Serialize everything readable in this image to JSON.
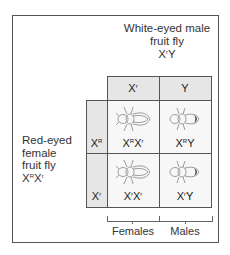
{
  "title": {
    "line1": "White-eyed male",
    "line2": "fruit fly",
    "genotype_base": "X",
    "genotype_sup": "r",
    "genotype_tail": "Y"
  },
  "side": {
    "line1": "Red-eyed",
    "line2": "female",
    "line3": "fruit fly",
    "genotype": [
      {
        "b": "X",
        "s": "R"
      },
      {
        "b": "X",
        "s": "r"
      }
    ]
  },
  "columns": [
    {
      "b": "X",
      "s": "r"
    },
    {
      "b": "Y",
      "s": ""
    }
  ],
  "rows": [
    {
      "b": "X",
      "s": "R"
    },
    {
      "b": "X",
      "s": "r"
    }
  ],
  "cells": [
    [
      {
        "a": "X",
        "as": "R",
        "b": "X",
        "bs": "r",
        "phenotype": "red-eyed female"
      },
      {
        "a": "X",
        "as": "R",
        "b": "Y",
        "bs": "",
        "phenotype": "red-eyed male"
      }
    ],
    [
      {
        "a": "X",
        "as": "r",
        "b": "X",
        "bs": "r",
        "phenotype": "white-eyed female"
      },
      {
        "a": "X",
        "as": "r",
        "b": "Y",
        "bs": "",
        "phenotype": "white-eyed male"
      }
    ]
  ],
  "footer": {
    "females": "Females",
    "males": "Males"
  },
  "colors": {
    "header_fill": "#e6e6e6",
    "cell_fill": "#f7f7f7",
    "border": "#555555"
  }
}
